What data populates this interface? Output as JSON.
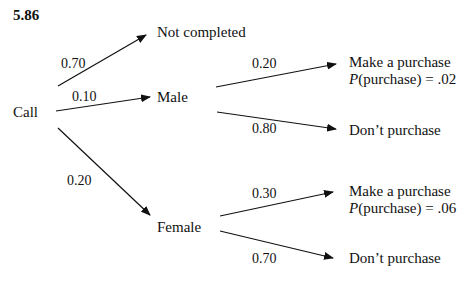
{
  "problem_number": "5.86",
  "root": "Call",
  "nodes": {
    "not_completed": "Not completed",
    "male": "Male",
    "female": "Female",
    "male_purchase": "Make a purchase",
    "male_purchase_prob_fn": "P",
    "male_purchase_prob": "(purchase) = .02",
    "male_no_purchase": "Don’t purchase",
    "female_purchase": "Make a purchase",
    "female_purchase_prob_fn": "P",
    "female_purchase_prob": "(purchase) = .06",
    "female_no_purchase": "Don’t purchase"
  },
  "edges": {
    "call_not_completed": "0.70",
    "call_male": "0.10",
    "call_female": "0.20",
    "male_purchase": "0.20",
    "male_no_purchase": "0.80",
    "female_purchase": "0.30",
    "female_no_purchase": "0.70"
  }
}
